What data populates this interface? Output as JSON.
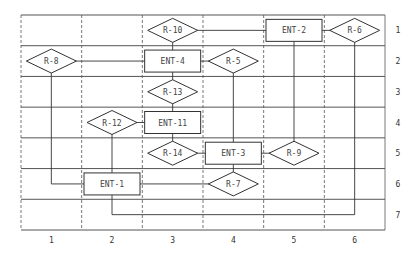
{
  "grid": {
    "columns": [
      "1",
      "2",
      "3",
      "4",
      "5",
      "6"
    ],
    "rows": [
      "1",
      "2",
      "3",
      "4",
      "5",
      "6",
      "7"
    ]
  },
  "entities": [
    {
      "id": "ENT-2",
      "col": 5,
      "row": 1
    },
    {
      "id": "ENT-4",
      "col": 3,
      "row": 2
    },
    {
      "id": "ENT-11",
      "col": 3,
      "row": 4
    },
    {
      "id": "ENT-3",
      "col": 4,
      "row": 5
    },
    {
      "id": "ENT-1",
      "col": 2,
      "row": 6
    }
  ],
  "relationships": [
    {
      "id": "R-10",
      "col": 3,
      "row": 1
    },
    {
      "id": "R-6",
      "col": 6,
      "row": 1
    },
    {
      "id": "R-8",
      "col": 1,
      "row": 2
    },
    {
      "id": "R-5",
      "col": 4,
      "row": 2
    },
    {
      "id": "R-13",
      "col": 3,
      "row": 3
    },
    {
      "id": "R-12",
      "col": 2,
      "row": 4
    },
    {
      "id": "R-14",
      "col": 3,
      "row": 5
    },
    {
      "id": "R-9",
      "col": 5,
      "row": 5
    },
    {
      "id": "R-7",
      "col": 4,
      "row": 6
    }
  ],
  "colors": {
    "line": "#333333",
    "grid": "#555555",
    "text": "#444444",
    "background": "#ffffff"
  }
}
